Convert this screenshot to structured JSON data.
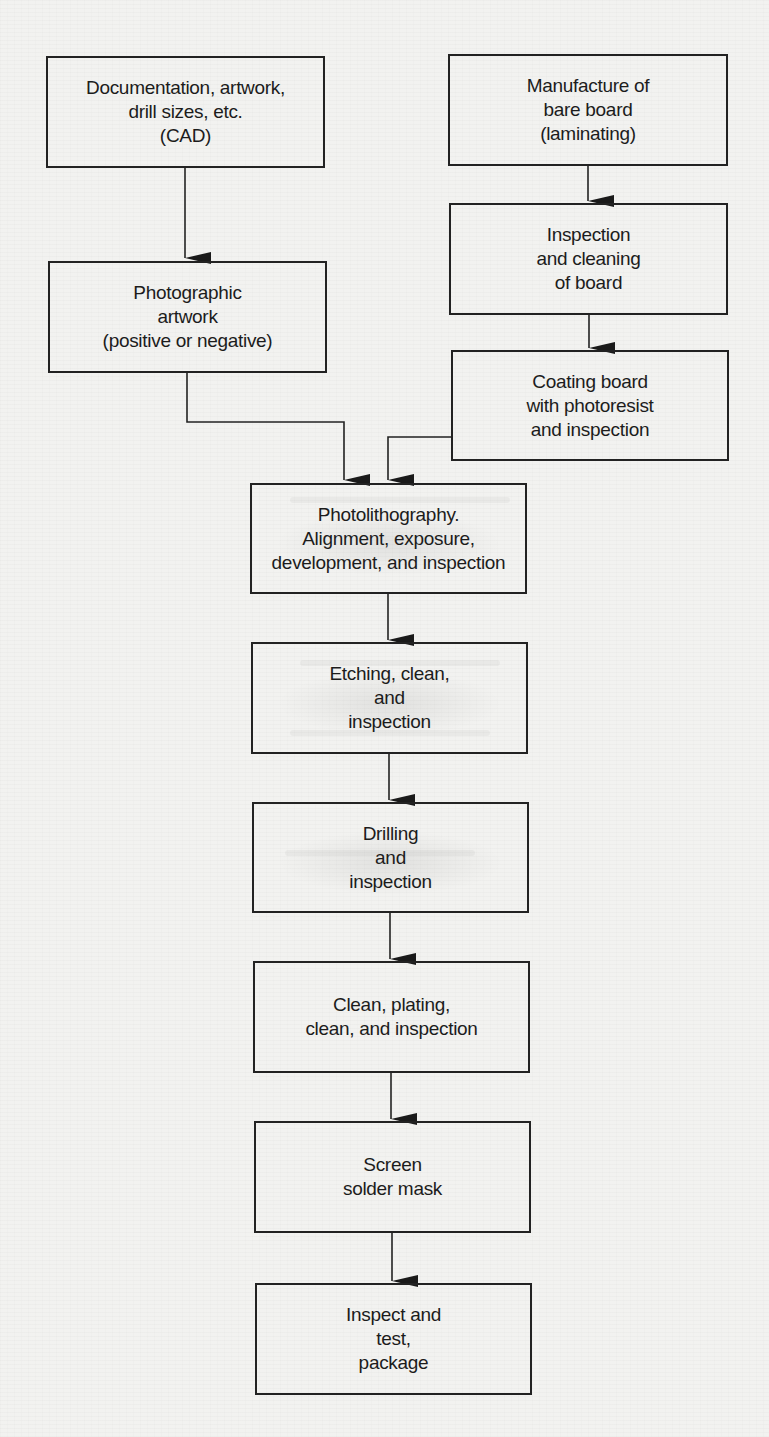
{
  "diagram": {
    "type": "flowchart",
    "nodes": [
      {
        "id": "cad",
        "label": "Documentation, artwork,\ndrill sizes, etc.\n(CAD)"
      },
      {
        "id": "bare_board",
        "label": "Manufacture of\nbare board\n(laminating)"
      },
      {
        "id": "inspect_clean",
        "label": "Inspection\nand cleaning\nof board"
      },
      {
        "id": "photo_artwork",
        "label": "Photographic\nartwork\n(positive or negative)"
      },
      {
        "id": "coating",
        "label": "Coating board\nwith photoresist\nand inspection"
      },
      {
        "id": "photolithography",
        "label": "Photolithography.\nAlignment, exposure,\ndevelopment, and inspection"
      },
      {
        "id": "etching",
        "label": "Etching, clean,\nand\ninspection"
      },
      {
        "id": "drilling",
        "label": "Drilling\nand\ninspection"
      },
      {
        "id": "plating",
        "label": "Clean, plating,\nclean, and inspection"
      },
      {
        "id": "solder_mask",
        "label": "Screen\nsolder mask"
      },
      {
        "id": "final",
        "label": "Inspect and\ntest,\npackage"
      }
    ],
    "edges": [
      {
        "from": "cad",
        "to": "photo_artwork"
      },
      {
        "from": "bare_board",
        "to": "inspect_clean"
      },
      {
        "from": "inspect_clean",
        "to": "coating"
      },
      {
        "from": "photo_artwork",
        "to": "photolithography"
      },
      {
        "from": "coating",
        "to": "photolithography"
      },
      {
        "from": "photolithography",
        "to": "etching"
      },
      {
        "from": "etching",
        "to": "drilling"
      },
      {
        "from": "drilling",
        "to": "plating"
      },
      {
        "from": "plating",
        "to": "solder_mask"
      },
      {
        "from": "solder_mask",
        "to": "final"
      }
    ],
    "colors": {
      "background": "#f2f2f0",
      "stroke": "#222222",
      "text": "#1c1c1c"
    }
  }
}
